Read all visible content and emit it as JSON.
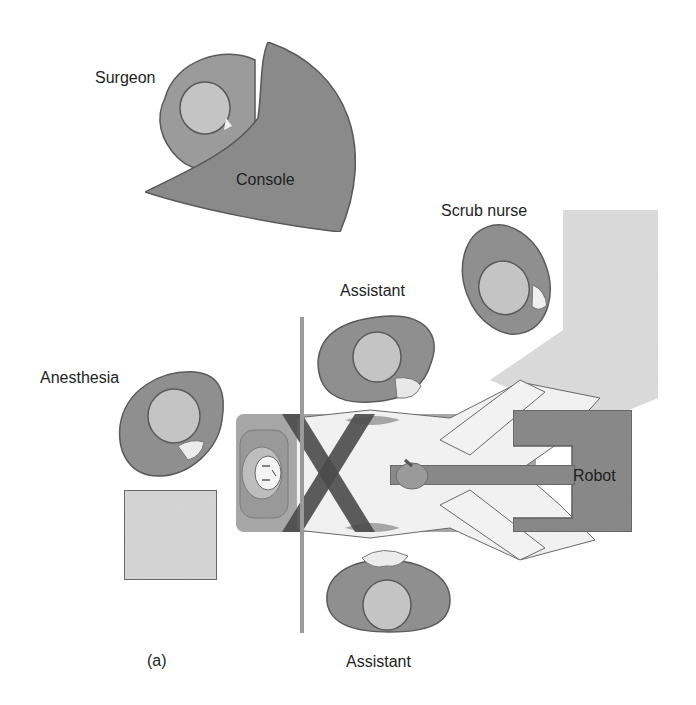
{
  "figure": {
    "panel_label": "(a)"
  },
  "labels": {
    "surgeon": "Surgeon",
    "console": "Console",
    "scrub_nurse": "Scrub nurse",
    "assistant_top": "Assistant",
    "anesthesia": "Anesthesia",
    "robot": "Robot",
    "assistant_bottom": "Assistant"
  },
  "colors": {
    "person_body": "#8f8f8f",
    "person_head": "#c4c4c4",
    "outline": "#5a5a5a",
    "console": "#8c8c8c",
    "robot": "#8a8a8a",
    "instrument_table": "#dcdcdc",
    "anesthesia_cart": "#d6d6d6",
    "bed": "#a9a9a9",
    "drape": "#f4f4f4",
    "straps": "#4a4a4a",
    "sterile_line": "#9a9a9a",
    "text": "#1e1e1e"
  }
}
